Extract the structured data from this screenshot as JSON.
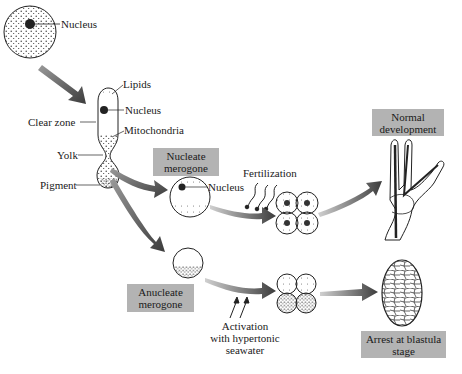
{
  "labels": {
    "nucleus_top": "Nucleus",
    "lipids": "Lipids",
    "nucleus_mid": "Nucleus",
    "clear_zone": "Clear zone",
    "mitochondria": "Mitochondria",
    "yolk": "Yolk",
    "pigment": "Pigment",
    "nucleus_merogone": "Nucleus",
    "fertilization": "Fertilization",
    "activation": "Activation\nwith hypertonic\nseawater"
  },
  "boxes": {
    "nucleate_merogone": "Nucleate\nmerogone",
    "anucleate_merogone": "Anucleate\nmerogone",
    "normal_development": "Normal\ndevelopment",
    "arrest_blastula": "Arrest at blastula\nstage"
  },
  "colors": {
    "box_fill": "#b3b3b3",
    "arrow_dark": "#4a4a4a",
    "arrow_light": "#bdbdbd",
    "stipple": "#333333"
  }
}
